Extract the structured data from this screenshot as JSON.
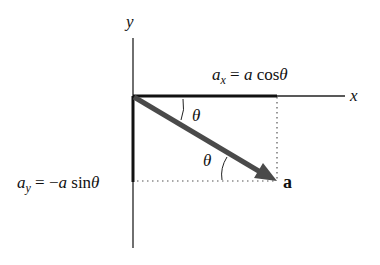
{
  "diagram": {
    "axes": {
      "x_label": "x",
      "y_label": "y"
    },
    "vector": {
      "label": "a",
      "color": "#4a4a4a"
    },
    "components": {
      "ax": {
        "lhs_main": "a",
        "lhs_sub": "x",
        "eq": " = ",
        "rhs_var": "a",
        "rhs_fn": " cos",
        "rhs_angle": "θ"
      },
      "ay": {
        "lhs_main": "a",
        "lhs_sub": "y",
        "eq": " = −",
        "rhs_var": "a",
        "rhs_fn": " sin",
        "rhs_angle": "θ"
      }
    },
    "angles": {
      "upper": "θ",
      "lower": "θ"
    },
    "colors": {
      "axis": "#222222",
      "component": "#111111",
      "vector": "#4a4a4a",
      "dotted": "#555555"
    }
  }
}
